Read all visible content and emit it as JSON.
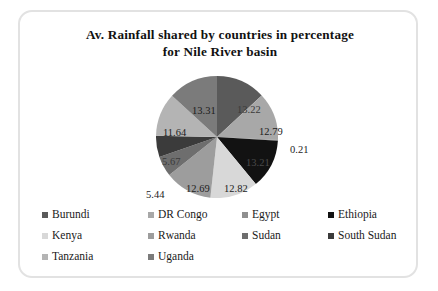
{
  "chart_data": {
    "type": "pie",
    "title": "Av. Rainfall  shared by countries  in percentage for Nile River  basin",
    "title_lines": [
      "Av. Rainfall  shared by countries  in percentage",
      "for Nile River  basin"
    ],
    "xlabel": "",
    "ylabel": "",
    "units": "percent",
    "legend_position": "bottom",
    "grid": false,
    "categories": [
      "Burundi",
      "DR Congo",
      "Egypt",
      "Ethiopia",
      "Kenya",
      "Rwanda",
      "Sudan",
      "South Sudan",
      "Tanzania",
      "Uganda"
    ],
    "values": [
      13.22,
      12.79,
      0.21,
      13.21,
      12.82,
      12.69,
      5.44,
      5.67,
      11.64,
      13.31
    ],
    "labels": [
      "13.22",
      "12.79",
      "0.21",
      "13.21",
      "12.82",
      "12.69",
      "5.44",
      "5.67",
      "11.64",
      "13.31"
    ],
    "colors": [
      "#5a5a5a",
      "#a8a8a8",
      "#8f8f8f",
      "#121212",
      "#d8d8d8",
      "#9d9d9d",
      "#6e6e6e",
      "#3b3b3b",
      "#b4b4b4",
      "#7b7b7b"
    ]
  },
  "pie": {
    "slices": [
      {
        "name": "Burundi",
        "value": 13.22,
        "label": "13.22",
        "color": "#5a5a5a",
        "label_pos": "top-right-inner",
        "label_x": "217px",
        "label_y": "30px",
        "label_class": "on-dark"
      },
      {
        "name": "DR Congo",
        "value": 12.79,
        "label": "12.79",
        "color": "#a8a8a8",
        "label_x": "239px",
        "label_y": "52px",
        "label_class": ""
      },
      {
        "name": "Egypt",
        "value": 0.21,
        "label": "0.21",
        "color": "#8f8f8f",
        "label_x": "270px",
        "label_y": "70px",
        "label_class": ""
      },
      {
        "name": "Ethiopia",
        "value": 13.21,
        "label": "13.21",
        "color": "#121212",
        "label_x": "226px",
        "label_y": "83px",
        "label_class": "on-black"
      },
      {
        "name": "Kenya",
        "value": 12.82,
        "label": "12.82",
        "color": "#d8d8d8",
        "label_x": "204px",
        "label_y": "109px",
        "label_class": ""
      },
      {
        "name": "Rwanda",
        "value": 12.69,
        "label": "12.69",
        "color": "#9d9d9d",
        "label_x": "166px",
        "label_y": "109px",
        "label_class": ""
      },
      {
        "name": "Sudan",
        "value": 5.44,
        "label": "5.44",
        "color": "#6e6e6e",
        "label_x": "126px",
        "label_y": "115px",
        "label_class": ""
      },
      {
        "name": "South Sudan",
        "value": 5.67,
        "label": "5.67",
        "color": "#3b3b3b",
        "label_x": "142px",
        "label_y": "82px",
        "label_class": "on-dark"
      },
      {
        "name": "Tanzania",
        "value": 11.64,
        "label": "11.64",
        "color": "#b4b4b4",
        "label_x": "143px",
        "label_y": "53px",
        "label_class": ""
      },
      {
        "name": "Uganda",
        "value": 13.31,
        "label": "13.31",
        "color": "#7b7b7b",
        "label_x": "172px",
        "label_y": "31px",
        "label_class": ""
      }
    ]
  },
  "legend": {
    "rows": [
      [
        {
          "label": "Burundi",
          "color": "#5a5a5a"
        },
        {
          "label": "DR Congo",
          "color": "#a8a8a8"
        },
        {
          "label": "Egypt",
          "color": "#8f8f8f"
        },
        {
          "label": "Ethiopia",
          "color": "#121212"
        }
      ],
      [
        {
          "label": "Kenya",
          "color": "#d8d8d8"
        },
        {
          "label": "Rwanda",
          "color": "#9d9d9d"
        },
        {
          "label": "Sudan",
          "color": "#6e6e6e"
        },
        {
          "label": "South Sudan",
          "color": "#3b3b3b"
        }
      ],
      [
        {
          "label": "Tanzania",
          "color": "#b4b4b4"
        },
        {
          "label": "Uganda",
          "color": "#7b7b7b"
        }
      ]
    ]
  }
}
